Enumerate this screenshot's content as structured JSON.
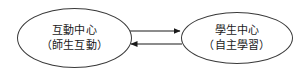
{
  "diagram": {
    "type": "flow-diagram",
    "background_color": "#ffffff",
    "stroke_color": "#3a3a3a",
    "text_color": "#1a1a1a",
    "nodes": [
      {
        "id": "interaction-center",
        "shape": "ellipse",
        "primary_label": "互動中心",
        "secondary_label": "（師生互動）"
      },
      {
        "id": "student-center",
        "shape": "ellipse",
        "primary_label": "學生中心",
        "secondary_label": "（自主學習）"
      }
    ],
    "connectors": [
      {
        "id": "arrow-left-to-right",
        "from": "interaction-center",
        "to": "student-center",
        "direction": "right",
        "label": "",
        "arrowhead": "filled-triangle"
      },
      {
        "id": "arrow-right-to-left",
        "from": "student-center",
        "to": "interaction-center",
        "direction": "left",
        "label": "",
        "arrowhead": "filled-triangle"
      }
    ]
  }
}
